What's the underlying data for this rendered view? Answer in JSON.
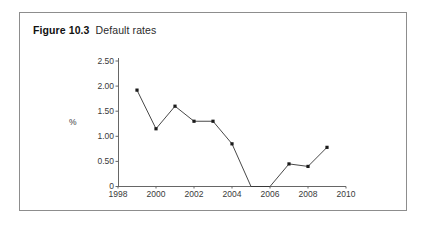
{
  "figure": {
    "number": "Figure 10.3",
    "title": "Default rates"
  },
  "chart_data": {
    "type": "line",
    "title": "Default rates",
    "xlabel": "",
    "ylabel": "%",
    "x": [
      1999,
      2000,
      2001,
      2002,
      2003,
      2004,
      2005,
      2006,
      2007,
      2008,
      2009
    ],
    "values": [
      1.92,
      1.15,
      1.6,
      1.3,
      1.3,
      0.85,
      0.0,
      0.0,
      0.45,
      0.4,
      0.78
    ],
    "series": [
      {
        "name": "Default rate",
        "values": [
          1.92,
          1.15,
          1.6,
          1.3,
          1.3,
          0.85,
          0.0,
          0.0,
          0.45,
          0.4,
          0.78
        ]
      }
    ],
    "xlim": [
      1998,
      2010
    ],
    "ylim": [
      0,
      2.5
    ],
    "xticks": [
      1998,
      2000,
      2002,
      2004,
      2006,
      2008,
      2010
    ],
    "xtick_labels": [
      "1998",
      "2000",
      "2002",
      "2004",
      "2006",
      "2008",
      "2010"
    ],
    "yticks": [
      0,
      0.5,
      1.0,
      1.5,
      2.0,
      2.5
    ],
    "ytick_labels": [
      "0",
      "0.50",
      "1.00",
      "1.50",
      "2.00",
      "2.50"
    ],
    "grid": false,
    "legend": null,
    "marker": "square",
    "line_color": "#333333",
    "marker_color": "#1a1a1a"
  },
  "axis": {
    "y_title": "%",
    "y_ticks": [
      "2.50",
      "2.00",
      "1.50",
      "1.00",
      "0.50",
      "0"
    ],
    "x_ticks": [
      "1998",
      "2000",
      "2002",
      "2004",
      "2006",
      "2008",
      "2010"
    ]
  }
}
